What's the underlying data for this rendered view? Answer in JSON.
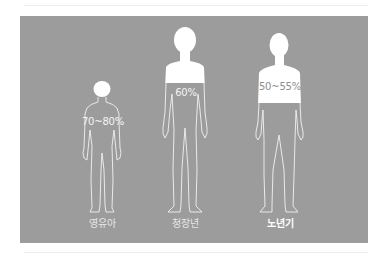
{
  "colors": {
    "panel": "#9c9c9c",
    "figure_line": "#ffffff",
    "fill": "#ffffff"
  },
  "figures": [
    {
      "name": "infant",
      "label": "영유아",
      "percentage": "70~80%"
    },
    {
      "name": "adult",
      "label": "청장년",
      "percentage": "60%"
    },
    {
      "name": "elderly",
      "label": "노년기",
      "percentage": "50~55%"
    }
  ]
}
